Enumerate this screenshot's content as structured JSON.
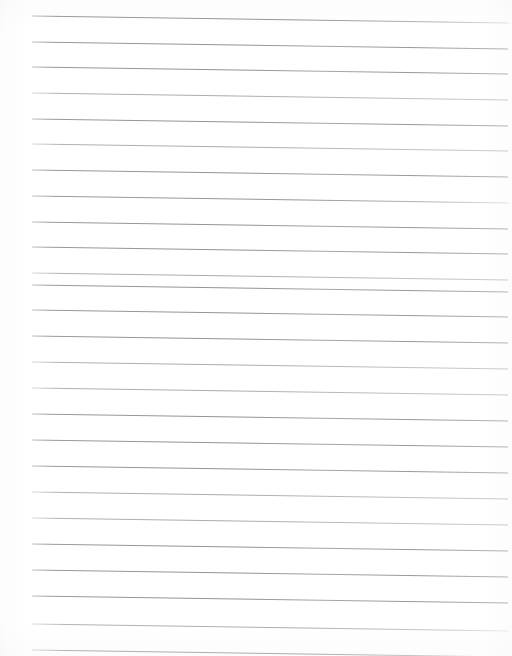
{
  "document": {
    "kind": "scanned-lined-paper",
    "title": "Blank ruled notebook page",
    "written_text": "",
    "page_width": 512,
    "page_height": 656,
    "background_color": "#ffffff"
  },
  "ruling": {
    "line_color": "#9a9a9e",
    "line_color_light": "#c2c2c6",
    "line_width": 0.9,
    "line_count": 25,
    "left_x": 32,
    "right_x": 508,
    "first_line_left_y": 16,
    "line_spacing": 25.7,
    "slope_drop_px": 7,
    "margin_rule": "none",
    "holes": "none",
    "lines": [
      {
        "index": 1,
        "left_y": 16,
        "right_y": 23,
        "shade": "medium",
        "right_fade": true
      },
      {
        "index": 2,
        "left_y": 42,
        "right_y": 49,
        "shade": "medium",
        "right_fade": false
      },
      {
        "index": 3,
        "left_y": 67,
        "right_y": 74,
        "shade": "medium",
        "right_fade": false
      },
      {
        "index": 4,
        "left_y": 93,
        "right_y": 100,
        "shade": "light",
        "right_fade": false
      },
      {
        "index": 5,
        "left_y": 119,
        "right_y": 126,
        "shade": "medium",
        "right_fade": false
      },
      {
        "index": 6,
        "left_y": 144,
        "right_y": 151,
        "shade": "light",
        "right_fade": false
      },
      {
        "index": 7,
        "left_y": 170,
        "right_y": 177,
        "shade": "medium",
        "right_fade": false
      },
      {
        "index": 8,
        "left_y": 196,
        "right_y": 203,
        "shade": "medium",
        "right_fade": true
      },
      {
        "index": 9,
        "left_y": 222,
        "right_y": 229,
        "shade": "medium",
        "right_fade": false
      },
      {
        "index": 10,
        "left_y": 247,
        "right_y": 254,
        "shade": "medium",
        "right_fade": false
      },
      {
        "index": 11,
        "left_y": 273,
        "right_y": 280,
        "shade": "light",
        "right_fade": false
      },
      {
        "index": 12,
        "left_y": 285,
        "right_y": 292,
        "shade": "medium",
        "right_fade": false
      },
      {
        "index": 13,
        "left_y": 310,
        "right_y": 317,
        "shade": "medium",
        "right_fade": false
      },
      {
        "index": 14,
        "left_y": 336,
        "right_y": 343,
        "shade": "medium",
        "right_fade": false
      },
      {
        "index": 15,
        "left_y": 362,
        "right_y": 369,
        "shade": "light",
        "right_fade": false
      },
      {
        "index": 16,
        "left_y": 388,
        "right_y": 395,
        "shade": "light",
        "right_fade": false
      },
      {
        "index": 17,
        "left_y": 414,
        "right_y": 421,
        "shade": "medium",
        "right_fade": false
      },
      {
        "index": 18,
        "left_y": 440,
        "right_y": 447,
        "shade": "medium",
        "right_fade": false
      },
      {
        "index": 19,
        "left_y": 466,
        "right_y": 473,
        "shade": "medium",
        "right_fade": false
      },
      {
        "index": 20,
        "left_y": 492,
        "right_y": 499,
        "shade": "light",
        "right_fade": false
      },
      {
        "index": 21,
        "left_y": 518,
        "right_y": 525,
        "shade": "light",
        "right_fade": false
      },
      {
        "index": 22,
        "left_y": 544,
        "right_y": 551,
        "shade": "medium",
        "right_fade": false
      },
      {
        "index": 23,
        "left_y": 570,
        "right_y": 577,
        "shade": "medium",
        "right_fade": false
      },
      {
        "index": 24,
        "left_y": 596,
        "right_y": 603,
        "shade": "medium",
        "right_fade": false
      },
      {
        "index": 25,
        "left_y": 624,
        "right_y": 631,
        "shade": "light",
        "right_fade": true
      },
      {
        "index": 26,
        "left_y": 650,
        "right_y": 657,
        "shade": "light",
        "right_fade": true
      }
    ]
  }
}
